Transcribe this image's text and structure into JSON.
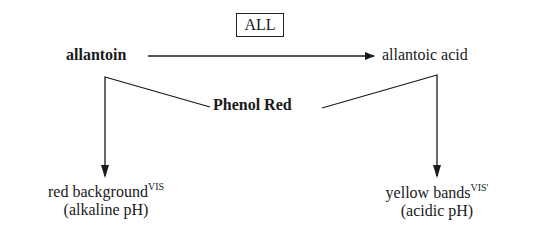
{
  "diagram": {
    "enzyme": {
      "label": "ALL"
    },
    "substrate": {
      "label": "allantoin"
    },
    "product": {
      "label": "allantoic acid"
    },
    "indicator": {
      "label": "Phenol Red"
    },
    "outcomes": [
      {
        "label": "red background",
        "superscript": "VIS",
        "condition": "(alkaline pH)"
      },
      {
        "label": "yellow bands",
        "superscript": "VIS'",
        "condition": "(acidic pH)"
      }
    ],
    "edges": [
      {
        "from": "allantoin",
        "to": "allantoic acid",
        "via": "ALL",
        "type": "arrow"
      },
      {
        "from": "allantoin",
        "to": "red background",
        "via": "Phenol Red",
        "type": "arrow"
      },
      {
        "from": "allantoic acid",
        "to": "yellow bands",
        "via": "Phenol Red",
        "type": "arrow"
      }
    ],
    "colors": {
      "ink": "#1a1a1a",
      "background": "#ffffff"
    }
  }
}
